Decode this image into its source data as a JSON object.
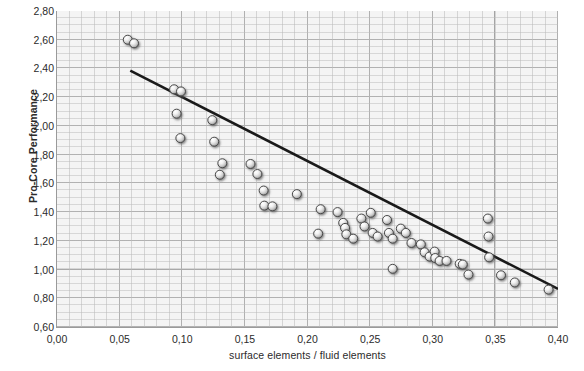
{
  "chart_data": {
    "type": "scatter",
    "title": "",
    "xlabel": "surface elements / fluid elements",
    "ylabel": "Pro-Core Performance",
    "xlim": [
      0.0,
      0.4
    ],
    "ylim": [
      0.6,
      2.8
    ],
    "xticks": [
      0.0,
      0.05,
      0.1,
      0.15,
      0.2,
      0.25,
      0.3,
      0.35,
      0.4
    ],
    "yticks": [
      0.6,
      0.8,
      1.0,
      1.2,
      1.4,
      1.6,
      1.8,
      2.0,
      2.2,
      2.4,
      2.6,
      2.8
    ],
    "xtick_labels": [
      "0,00",
      "0,05",
      "0,10",
      "0,15",
      "0,20",
      "0,25",
      "0,30",
      "0,35",
      "0,40"
    ],
    "ytick_labels": [
      "0,60",
      "0,80",
      "1,00",
      "1,20",
      "1,40",
      "1,60",
      "1,80",
      "2,00",
      "2,20",
      "2,40",
      "2,60",
      "2,80"
    ],
    "grid": true,
    "grid_minor": true,
    "legend": null,
    "decimal_separator": ",",
    "marker": {
      "style": "sphere",
      "size_px": 9,
      "fill": "#e9e9e9",
      "edge": "#4a4a4a"
    },
    "series": [
      {
        "name": "measurements",
        "points": [
          [
            0.0565,
            2.6
          ],
          [
            0.0615,
            2.575
          ],
          [
            0.0935,
            2.255
          ],
          [
            0.099,
            2.24
          ],
          [
            0.0955,
            2.085
          ],
          [
            0.0985,
            1.915
          ],
          [
            0.124,
            2.04
          ],
          [
            0.1255,
            1.89
          ],
          [
            0.132,
            1.74
          ],
          [
            0.13,
            1.66
          ],
          [
            0.1545,
            1.735
          ],
          [
            0.16,
            1.665
          ],
          [
            0.165,
            1.55
          ],
          [
            0.1655,
            1.445
          ],
          [
            0.172,
            1.44
          ],
          [
            0.1915,
            1.525
          ],
          [
            0.2105,
            1.42
          ],
          [
            0.2085,
            1.25
          ],
          [
            0.224,
            1.4
          ],
          [
            0.2285,
            1.325
          ],
          [
            0.23,
            1.29
          ],
          [
            0.231,
            1.245
          ],
          [
            0.2365,
            1.215
          ],
          [
            0.243,
            1.355
          ],
          [
            0.2455,
            1.3
          ],
          [
            0.2505,
            1.395
          ],
          [
            0.252,
            1.255
          ],
          [
            0.256,
            1.23
          ],
          [
            0.2635,
            1.345
          ],
          [
            0.265,
            1.255
          ],
          [
            0.268,
            1.215
          ],
          [
            0.268,
            1.005
          ],
          [
            0.2745,
            1.285
          ],
          [
            0.2785,
            1.255
          ],
          [
            0.283,
            1.185
          ],
          [
            0.2905,
            1.175
          ],
          [
            0.2935,
            1.12
          ],
          [
            0.2975,
            1.09
          ],
          [
            0.3015,
            1.125
          ],
          [
            0.302,
            1.08
          ],
          [
            0.3055,
            1.06
          ],
          [
            0.311,
            1.06
          ],
          [
            0.3215,
            1.04
          ],
          [
            0.324,
            1.035
          ],
          [
            0.3285,
            0.965
          ],
          [
            0.344,
            1.355
          ],
          [
            0.3445,
            1.23
          ],
          [
            0.345,
            1.085
          ],
          [
            0.3545,
            0.96
          ],
          [
            0.3655,
            0.91
          ],
          [
            0.3925,
            0.86
          ]
        ]
      }
    ],
    "trendline": {
      "name": "linear fit",
      "x_start": 0.0585,
      "y_start": 2.385,
      "x_end": 0.4,
      "y_end": 0.865,
      "color": "#1a1a1a",
      "width_px": 2.6
    }
  }
}
